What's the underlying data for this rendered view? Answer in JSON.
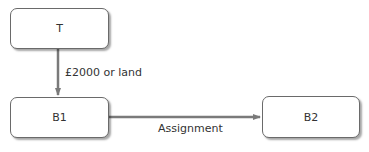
{
  "nodes": {
    "t": {
      "label": "T"
    },
    "b1": {
      "label": "B1"
    },
    "b2": {
      "label": "B2"
    }
  },
  "edges": {
    "t_to_b1": {
      "label": "£2000 or land"
    },
    "b1_to_b2": {
      "label": "Assignment"
    }
  },
  "colors": {
    "arrow": "#7a7a7a",
    "border": "#6a6a6a"
  }
}
